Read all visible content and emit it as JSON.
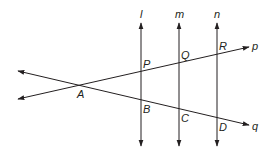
{
  "diagram": {
    "colors": {
      "stroke": "#231f20",
      "background": "#ffffff"
    },
    "parallel_lines": [
      {
        "label": "l",
        "x": 141
      },
      {
        "label": "m",
        "x": 179
      },
      {
        "label": "n",
        "x": 217
      }
    ],
    "transversals": [
      {
        "label": "p",
        "from": [
          18,
          99
        ],
        "to": [
          249,
          47
        ]
      },
      {
        "label": "q",
        "from": [
          18,
          71
        ],
        "to": [
          249,
          125
        ]
      }
    ],
    "points": {
      "A": "A",
      "P": "P",
      "Q": "Q",
      "R": "R",
      "B": "B",
      "C": "C",
      "D": "D"
    },
    "line_labels": {
      "l": "l",
      "m": "m",
      "n": "n",
      "p": "p",
      "q": "q"
    }
  }
}
